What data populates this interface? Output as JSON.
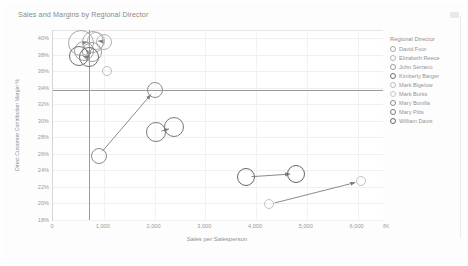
{
  "chart_title": "Sales and Margins by Regional Director",
  "corner_icon": "resize-handle-icon",
  "legend": {
    "title": "Regional Director",
    "items": [
      {
        "label": "David Foor",
        "color": "#a9a9a9"
      },
      {
        "label": "Elizabeth Reece",
        "color": "#b4b4b4"
      },
      {
        "label": "John Serrano",
        "color": "#9e9e9e"
      },
      {
        "label": "Kimberly Barger",
        "color": "#6e6e6e"
      },
      {
        "label": "Mark Bigelow",
        "color": "#bdbdbd"
      },
      {
        "label": "Mark Burks",
        "color": "#c4c4c4"
      },
      {
        "label": "Mary Bonilla",
        "color": "#8c8c8c"
      },
      {
        "label": "Mary Pitts",
        "color": "#7a7a7a"
      },
      {
        "label": "William Davis",
        "color": "#666666"
      }
    ]
  },
  "axis": {
    "x_title": "Sales per Salesperson",
    "y_title": "Direct Customer Contribution Margin %",
    "x_ticks": [
      "0",
      "1,000",
      "2,000",
      "3,000",
      "4,000",
      "5,000",
      "6,000"
    ],
    "y_ticks": [
      "40%",
      "38%",
      "36%",
      "34%",
      "32%",
      "30%",
      "28%",
      "26%",
      "24%",
      "22%",
      "20%",
      "18%"
    ],
    "x_overflow_label": "8K"
  },
  "chart_data": {
    "type": "scatter",
    "title": "Sales and Margins by Regional Director",
    "xlabel": "Sales per Salesperson",
    "ylabel": "Direct Customer Contribution Margin %",
    "xlim": [
      0,
      6500
    ],
    "ylim": [
      18,
      41
    ],
    "grid": true,
    "legend_position": "right",
    "reference_lines": {
      "x": 700,
      "y": 33.7
    },
    "series": [
      {
        "name": "David Foor",
        "color": "#a9a9a9",
        "points": [
          {
            "x": 560,
            "y": 39.4,
            "size": 13
          },
          {
            "x": 780,
            "y": 39.6,
            "size": 11
          }
        ]
      },
      {
        "name": "Elizabeth Reece",
        "color": "#b4b4b4",
        "points": [
          {
            "x": 840,
            "y": 39.7,
            "size": 9
          },
          {
            "x": 1000,
            "y": 39.6,
            "size": 8
          }
        ]
      },
      {
        "name": "John Serrano",
        "color": "#9e9e9e",
        "points": [
          {
            "x": 620,
            "y": 38.4,
            "size": 10
          },
          {
            "x": 760,
            "y": 38.3,
            "size": 10
          }
        ]
      },
      {
        "name": "Kimberly Barger",
        "color": "#6e6e6e",
        "points": [
          {
            "x": 520,
            "y": 37.9,
            "size": 10
          },
          {
            "x": 700,
            "y": 37.7,
            "size": 10
          }
        ]
      },
      {
        "name": "Mark Bigelow",
        "color": "#bdbdbd",
        "points": [
          {
            "x": 1060,
            "y": 36.0,
            "size": 5
          }
        ]
      },
      {
        "name": "Mark Burks",
        "color": "#c4c4c4",
        "points": [
          {
            "x": 4260,
            "y": 19.9,
            "size": 5
          },
          {
            "x": 6060,
            "y": 22.7,
            "size": 5
          }
        ]
      },
      {
        "name": "Mary Bonilla",
        "color": "#8c8c8c",
        "points": [
          {
            "x": 900,
            "y": 25.8,
            "size": 8
          },
          {
            "x": 2000,
            "y": 33.7,
            "size": 8
          }
        ]
      },
      {
        "name": "Mary Pitts",
        "color": "#7a7a7a",
        "points": [
          {
            "x": 2030,
            "y": 28.6,
            "size": 10
          },
          {
            "x": 2390,
            "y": 29.2,
            "size": 10
          }
        ]
      },
      {
        "name": "William Davis",
        "color": "#666666",
        "points": [
          {
            "x": 3800,
            "y": 23.2,
            "size": 9
          },
          {
            "x": 4780,
            "y": 23.6,
            "size": 9
          }
        ]
      }
    ],
    "arrows": [
      {
        "series": "Mary Bonilla",
        "from": {
          "x": 900,
          "y": 25.8
        },
        "to": {
          "x": 2000,
          "y": 33.7
        }
      },
      {
        "series": "Mary Pitts",
        "from": {
          "x": 2030,
          "y": 28.6
        },
        "to": {
          "x": 2390,
          "y": 29.2
        }
      },
      {
        "series": "William Davis",
        "from": {
          "x": 3800,
          "y": 23.2
        },
        "to": {
          "x": 4780,
          "y": 23.6
        }
      },
      {
        "series": "Mark Burks",
        "from": {
          "x": 4260,
          "y": 19.9
        },
        "to": {
          "x": 6060,
          "y": 22.7
        }
      },
      {
        "series": "David Foor",
        "from": {
          "x": 560,
          "y": 39.4
        },
        "to": {
          "x": 780,
          "y": 39.6
        }
      },
      {
        "series": "Elizabeth Reece",
        "from": {
          "x": 840,
          "y": 39.7
        },
        "to": {
          "x": 1000,
          "y": 39.6
        }
      },
      {
        "series": "John Serrano",
        "from": {
          "x": 620,
          "y": 38.4
        },
        "to": {
          "x": 760,
          "y": 38.3
        }
      },
      {
        "series": "Kimberly Barger",
        "from": {
          "x": 520,
          "y": 37.9
        },
        "to": {
          "x": 700,
          "y": 37.7
        }
      }
    ]
  }
}
